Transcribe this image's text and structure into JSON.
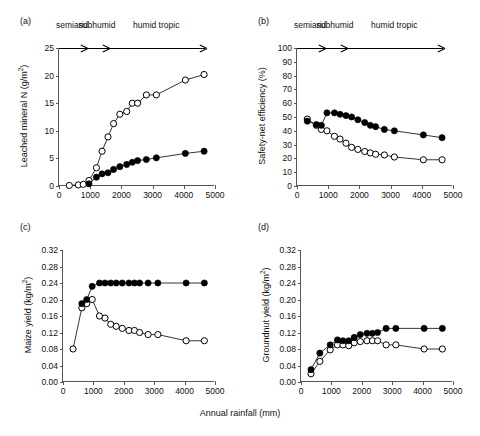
{
  "figure": {
    "xlabel": "Annual rainfall (mm)",
    "zones": [
      "semiarid",
      "subhumid",
      "humid tropic"
    ]
  },
  "chart_data": [
    {
      "type": "line",
      "panel": "(a)",
      "title": "",
      "xlabel": "Annual rainfall (mm)",
      "ylabel": "Leached mineral N (g/m2)",
      "ylabel_html": "Leached mineral N (g/m<sup>2</sup>)",
      "xlim": [
        0,
        5000
      ],
      "ylim": [
        0,
        25
      ],
      "xticks": [
        0,
        1000,
        2000,
        3000,
        4000,
        5000
      ],
      "yticks": [
        0,
        5,
        10,
        15,
        20,
        25
      ],
      "grid": false,
      "legend": "none",
      "zone_bounds": [
        900,
        1600,
        4700
      ],
      "series": [
        {
          "name": "open-circle",
          "marker": "open",
          "x": [
            330,
            620,
            780,
            960,
            1200,
            1380,
            1570,
            1750,
            1950,
            2170,
            2350,
            2520,
            2800,
            3120,
            4050,
            4650
          ],
          "y": [
            0.1,
            0.2,
            0.3,
            1.0,
            3.3,
            6.3,
            8.9,
            11.3,
            13.0,
            13.5,
            15.0,
            15.0,
            16.5,
            16.5,
            19.2,
            20.2
          ]
        },
        {
          "name": "filled-circle",
          "marker": "filled",
          "x": [
            960,
            1200,
            1380,
            1570,
            1750,
            1950,
            2170,
            2350,
            2520,
            2800,
            3120,
            4050,
            4650
          ],
          "y": [
            0.4,
            1.6,
            2.2,
            2.4,
            3.0,
            3.5,
            3.9,
            4.3,
            4.6,
            4.8,
            5.1,
            5.9,
            6.3
          ]
        }
      ]
    },
    {
      "type": "line",
      "panel": "(b)",
      "title": "",
      "xlabel": "Annual rainfall (mm)",
      "ylabel": "Safety-net efficiency (%)",
      "ylabel_html": "Safety-net efficiency (%)",
      "xlim": [
        0,
        5000
      ],
      "ylim": [
        0,
        100
      ],
      "xticks": [
        0,
        1000,
        2000,
        3000,
        4000,
        5000
      ],
      "yticks": [
        0,
        10,
        20,
        30,
        40,
        50,
        60,
        70,
        80,
        90,
        100
      ],
      "grid": false,
      "legend": "none",
      "zone_bounds": [
        900,
        1600,
        4700
      ],
      "series": [
        {
          "name": "open-circle",
          "marker": "open",
          "x": [
            330,
            620,
            780,
            960,
            1200,
            1380,
            1570,
            1750,
            1950,
            2170,
            2350,
            2520,
            2800,
            3120,
            4050,
            4650
          ],
          "y": [
            48.5,
            44.0,
            41.0,
            40.0,
            36.0,
            34.0,
            31.0,
            28.0,
            26.5,
            25.0,
            24.0,
            23.0,
            22.5,
            21.0,
            19.0,
            19.0
          ]
        },
        {
          "name": "filled-circle",
          "marker": "filled",
          "x": [
            330,
            620,
            780,
            960,
            1200,
            1380,
            1570,
            1750,
            1950,
            2170,
            2350,
            2520,
            2800,
            3120,
            4050,
            4650
          ],
          "y": [
            47.0,
            44.5,
            44.0,
            53.0,
            53.0,
            52.0,
            51.0,
            50.0,
            48.0,
            46.0,
            44.0,
            43.0,
            41.0,
            40.0,
            37.0,
            35.0
          ]
        }
      ]
    },
    {
      "type": "line",
      "panel": "(c)",
      "title": "",
      "xlabel": "Annual rainfall (mm)",
      "ylabel": "Maize yield (kg/m2)",
      "ylabel_html": "Maize yield (kg/m<sup>2</sup>)",
      "xlim": [
        0,
        5000
      ],
      "ylim": [
        0.0,
        0.32
      ],
      "xticks": [
        0,
        1000,
        2000,
        3000,
        4000,
        5000
      ],
      "yticks": [
        0.0,
        0.04,
        0.08,
        0.12,
        0.16,
        0.2,
        0.24,
        0.28,
        0.32
      ],
      "ytick_labels": [
        "0.00",
        "0.04",
        "0.08",
        "0.12",
        "0.16",
        "0.20",
        "0.24",
        "0.28",
        "0.32"
      ],
      "grid": false,
      "legend": "none",
      "zone_bounds": [
        900,
        1600,
        4700
      ],
      "series": [
        {
          "name": "open-circle",
          "marker": "open",
          "x": [
            330,
            620,
            780,
            960,
            1200,
            1380,
            1570,
            1750,
            1950,
            2170,
            2350,
            2520,
            2800,
            3120,
            4050,
            4650
          ],
          "y": [
            0.08,
            0.18,
            0.19,
            0.2,
            0.16,
            0.155,
            0.14,
            0.135,
            0.13,
            0.125,
            0.125,
            0.12,
            0.115,
            0.115,
            0.1,
            0.1
          ]
        },
        {
          "name": "filled-circle",
          "marker": "filled",
          "x": [
            620,
            780,
            960,
            1200,
            1380,
            1570,
            1750,
            1950,
            2170,
            2350,
            2520,
            2800,
            3120,
            4050,
            4650
          ],
          "y": [
            0.19,
            0.2,
            0.232,
            0.24,
            0.24,
            0.24,
            0.24,
            0.24,
            0.24,
            0.24,
            0.24,
            0.24,
            0.24,
            0.24,
            0.24
          ]
        }
      ]
    },
    {
      "type": "line",
      "panel": "(d)",
      "title": "",
      "xlabel": "Annual rainfall (mm)",
      "ylabel": "Groundnut yield (kg/m2)",
      "ylabel_html": "Groundnut yield (kg/m<sup>2</sup>)",
      "xlim": [
        0,
        5000
      ],
      "ylim": [
        0.0,
        0.32
      ],
      "xticks": [
        0,
        1000,
        2000,
        3000,
        4000,
        5000
      ],
      "yticks": [
        0.0,
        0.04,
        0.08,
        0.12,
        0.16,
        0.2,
        0.24,
        0.28,
        0.32
      ],
      "ytick_labels": [
        "0.00",
        "0.04",
        "0.08",
        "0.12",
        "0.16",
        "0.20",
        "0.24",
        "0.28",
        "0.32"
      ],
      "grid": false,
      "legend": "none",
      "zone_bounds": [
        900,
        1600,
        4700
      ],
      "series": [
        {
          "name": "open-circle",
          "marker": "open",
          "x": [
            330,
            620,
            960,
            1200,
            1380,
            1570,
            1750,
            1950,
            2170,
            2350,
            2520,
            2800,
            3120,
            4050,
            4650
          ],
          "y": [
            0.02,
            0.05,
            0.078,
            0.09,
            0.09,
            0.088,
            0.095,
            0.098,
            0.1,
            0.1,
            0.1,
            0.09,
            0.09,
            0.08,
            0.08
          ]
        },
        {
          "name": "filled-circle",
          "marker": "filled",
          "x": [
            330,
            620,
            960,
            1200,
            1380,
            1570,
            1750,
            1950,
            2170,
            2350,
            2520,
            2800,
            3120,
            4050,
            4650
          ],
          "y": [
            0.03,
            0.07,
            0.09,
            0.102,
            0.1,
            0.1,
            0.108,
            0.115,
            0.118,
            0.118,
            0.12,
            0.13,
            0.13,
            0.13,
            0.13
          ]
        }
      ]
    }
  ]
}
